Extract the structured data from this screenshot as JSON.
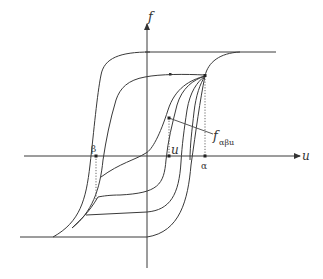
{
  "diagram": {
    "type": "hysteresis-loop (Preisach model)",
    "axes": {
      "x_label": "u",
      "y_label": "f"
    },
    "labels": {
      "alpha": "α",
      "beta": "β",
      "u_point": "u",
      "f_main": "f",
      "f_sub": "αβu"
    },
    "points": [
      {
        "name": "alpha",
        "label": "α",
        "on": "u-axis"
      },
      {
        "name": "beta",
        "label": "β",
        "on": "u-axis"
      },
      {
        "name": "u",
        "label": "u",
        "on": "u-axis"
      },
      {
        "name": "f_alpha_beta_u",
        "label": "f_αβu",
        "on": "first-order reversal curve"
      }
    ],
    "colors": {
      "stroke": "#3a3a3a",
      "background": "#ffffff"
    }
  }
}
